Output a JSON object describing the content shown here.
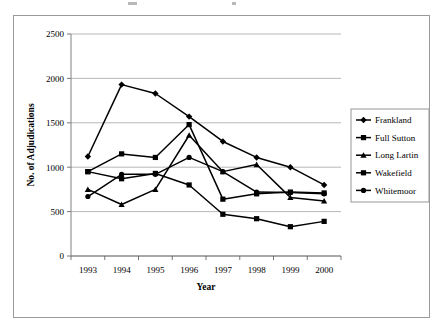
{
  "chart_data": {
    "type": "line",
    "title": "",
    "xlabel": "Year",
    "ylabel": "No. of Adjudications",
    "categories": [
      "1993",
      "1994",
      "1995",
      "1996",
      "1997",
      "1998",
      "1999",
      "2000"
    ],
    "ylim": [
      0,
      2500
    ],
    "yticks": [
      0,
      500,
      1000,
      1500,
      2000,
      2500
    ],
    "ytick_labels": [
      "0",
      "500",
      "1000",
      "1500",
      "2000",
      "2500"
    ],
    "grid": true,
    "legend_position": "right",
    "series": [
      {
        "name": "Frankland",
        "marker": "diamond",
        "values": [
          1120,
          1930,
          1830,
          1570,
          1290,
          1110,
          1000,
          800
        ]
      },
      {
        "name": "Full Sutton",
        "marker": "square",
        "values": [
          950,
          870,
          930,
          800,
          470,
          420,
          330,
          390
        ]
      },
      {
        "name": "Long Lartin",
        "marker": "triangle",
        "values": [
          750,
          580,
          750,
          1360,
          950,
          1030,
          660,
          620
        ]
      },
      {
        "name": "Wakefield",
        "marker": "square",
        "values": [
          950,
          1150,
          1110,
          1480,
          640,
          700,
          720,
          710
        ]
      },
      {
        "name": "Whitemoor",
        "marker": "circle",
        "values": [
          670,
          920,
          920,
          1110,
          950,
          720,
          715,
          700
        ]
      }
    ]
  },
  "legend": {
    "items": [
      {
        "label": "Frankland"
      },
      {
        "label": "Full Sutton"
      },
      {
        "label": "Long Lartin"
      },
      {
        "label": "Wakefield"
      },
      {
        "label": "Whitemoor"
      }
    ]
  },
  "colors": {
    "series": "#000000",
    "grid": "#a6a6a6",
    "axis": "#808080",
    "frame": "#9a9a9a",
    "background": "#ffffff"
  }
}
